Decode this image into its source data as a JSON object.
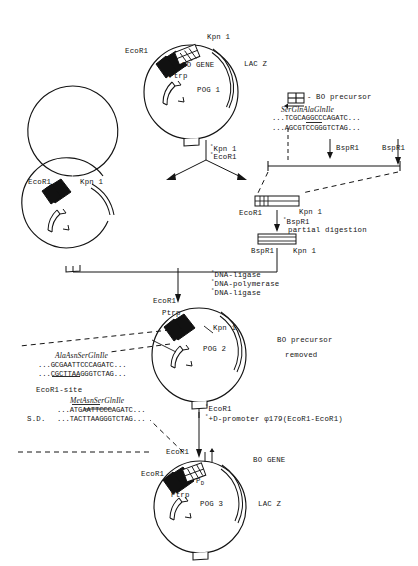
{
  "figure": {
    "title_hidden": "Construction scheme of plasmids POG 1, POG 2 and POG 3",
    "type": "molecular-cloning-flow-diagram"
  },
  "plasmid_pog1": {
    "name": "POG 1",
    "label_ecor1": "EcoR1",
    "label_kpn1": "Kpn 1",
    "label_bo_gene": "BO GENE",
    "label_ptrp": "Ptrp",
    "label_lacz": "LAC Z",
    "label_ap": "Ap"
  },
  "legend": {
    "key_label": "BO precursor",
    "key_dash": "-"
  },
  "seq_block_top": {
    "aa": "SerGlnAlaGlnIle",
    "top": "...TCGCAGGCCCAGATC...",
    "bottom": "...AGCGTCCGGGTCTAG..."
  },
  "enzymes_bspri": {
    "left": "BspR1",
    "right": "BspR1"
  },
  "step_cut_1": {
    "line1": "Kpn 1",
    "line2": "EcoR1",
    "marker": "°"
  },
  "plasmid_vector": {
    "label_ecor1": "EcoR1",
    "label_kpn1": "Kpn 1",
    "label_ap": "Ap"
  },
  "fragment_upper": {
    "label_ecor1": "EcoR1",
    "label_kpn1": "Kpn 1"
  },
  "step_partial": {
    "line1": "BspR1",
    "line2": "partial digestion",
    "marker": "°"
  },
  "fragment_lower": {
    "label_bspr1": "BspR1",
    "label_kpn1": "Kpn 1"
  },
  "step_ligate": {
    "line1": "DNA-ligase",
    "line2": "DNA-polymerase",
    "line3": "DNA-ligase",
    "marker": "°"
  },
  "plasmid_pog2": {
    "name": "POG 2",
    "label_ecor1": "EcoR1",
    "label_ptrp": "Ptrp",
    "label_kpn1": "Kpn 1",
    "label_ap": "Ap",
    "note_line1": "BO precursor",
    "note_line2": "removed"
  },
  "seq_block_mid": {
    "aa": "AlaAsnSerGlnIle",
    "top": "...GCGAATTCCCAGATC...",
    "bottom": "...CGCTTAAGGGTCTAG...",
    "site": "EcoR1-site"
  },
  "seq_block_bottom": {
    "aa": "MetAsnSerGlnIle",
    "top": "...ATGAATTCCCAGATC...",
    "bottom": "...TACTTAAGGGTCTAG...",
    "sd": "S.D."
  },
  "step_dpromoter": {
    "line1": "EcoR1",
    "line2": "+D-promoter φ179(EcoR1-EcoR1)",
    "marker1": "°",
    "marker2": "°"
  },
  "plasmid_pog3": {
    "name": "POG 3",
    "label_ecor1_top": "EcoR1",
    "label_ecor1_left": "EcoR1",
    "label_pd": "P",
    "label_pd_sub": "D",
    "label_ptrp": "Ptrp",
    "label_bo_gene": "BO GENE",
    "label_lacz": "LAC Z",
    "label_ap": "Ap"
  },
  "colors": {
    "ink": "#141414",
    "fill_black": "#000000",
    "page": "#ffffff"
  }
}
